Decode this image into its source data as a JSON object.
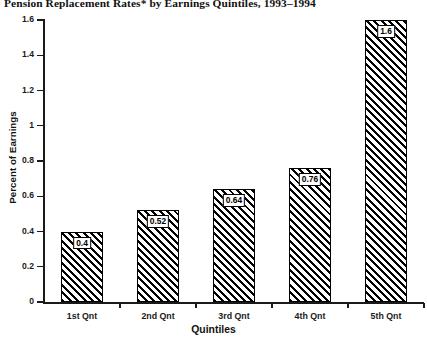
{
  "chart_data": {
    "type": "bar",
    "title": "Pension Replacement Rates* by Earnings Quintiles, 1993–1994",
    "xlabel": "Quintiles",
    "ylabel": "Percent of Earnings",
    "categories": [
      "1st Qnt",
      "2nd Qnt",
      "3rd Qnt",
      "4th Qnt",
      "5th Qnt"
    ],
    "values": [
      0.4,
      0.52,
      0.64,
      0.76,
      1.6
    ],
    "value_labels": [
      "0.4",
      "0.52",
      "0.64",
      "0.76",
      "1.6"
    ],
    "ylim": [
      0,
      1.6
    ],
    "yticks": [
      0,
      0.2,
      0.4,
      0.6,
      0.8,
      1,
      1.2,
      1.4,
      1.6
    ],
    "ytick_labels": [
      "0",
      "0.2",
      "0.4",
      "0.6",
      "0.8",
      "1",
      "1.2",
      "1.4",
      "1.6"
    ],
    "grid": false,
    "legend": null,
    "series": [
      {
        "name": "Pension Replacement Rate",
        "values": [
          0.4,
          0.52,
          0.64,
          0.76,
          1.6
        ]
      }
    ],
    "bar_fill": "diagonal-hatch",
    "colors": {
      "axis": "#1a1a1a",
      "bar_outline": "#000000",
      "bar_hatch": "#000000",
      "background": "#ffffff"
    }
  }
}
